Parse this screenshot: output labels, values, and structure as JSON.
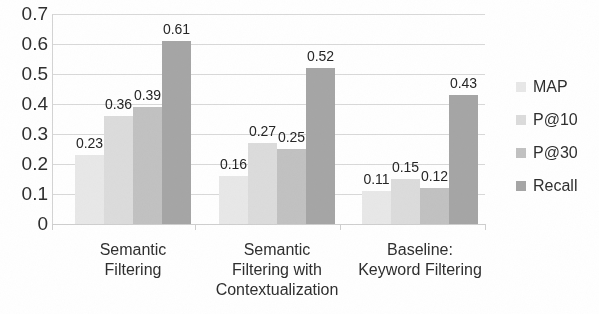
{
  "chart_data": {
    "type": "bar",
    "title": "",
    "xlabel": "",
    "ylabel": "",
    "ylim": [
      0,
      0.7
    ],
    "ytick_labels": [
      "0.7",
      "0.6",
      "0.5",
      "0.4",
      "0.3",
      "0.2",
      "0.1",
      "0"
    ],
    "ytick_values": [
      0.7,
      0.6,
      0.5,
      0.4,
      0.3,
      0.2,
      0.1,
      0
    ],
    "grid": true,
    "legend_position": "right",
    "categories": [
      "Semantic Filtering",
      "Semantic Filtering with Contextualization",
      "Baseline: Keyword Filtering"
    ],
    "category_lines": [
      [
        "Semantic",
        "Filtering"
      ],
      [
        "Semantic",
        "Filtering with",
        "Contextualization"
      ],
      [
        "Baseline:",
        "Keyword Filtering"
      ]
    ],
    "series": [
      {
        "name": "MAP",
        "color": "#e8e8e8",
        "values": [
          0.23,
          0.16,
          0.11
        ],
        "labels": [
          "0.23",
          "0.16",
          "0.11"
        ]
      },
      {
        "name": "P@10",
        "color": "#dcdcdc",
        "values": [
          0.36,
          0.27,
          0.15
        ],
        "labels": [
          "0.36",
          "0.27",
          "0.15"
        ]
      },
      {
        "name": "P@30",
        "color": "#c2c2c2",
        "values": [
          0.39,
          0.25,
          0.12
        ],
        "labels": [
          "0.39",
          "0.25",
          "0.12"
        ]
      },
      {
        "name": "Recall",
        "color": "#a6a6a6",
        "values": [
          0.61,
          0.52,
          0.43
        ],
        "labels": [
          "0.61",
          "0.52",
          "0.43"
        ]
      }
    ]
  },
  "legend": {
    "items": [
      {
        "label": "MAP",
        "color": "#e8e8e8"
      },
      {
        "label": "P@10",
        "color": "#dcdcdc"
      },
      {
        "label": "P@30",
        "color": "#c2c2c2"
      },
      {
        "label": "Recall",
        "color": "#a6a6a6"
      }
    ]
  },
  "axis": {
    "y_ticks": [
      "0.7",
      "0.6",
      "0.5",
      "0.4",
      "0.3",
      "0.2",
      "0.1",
      "0"
    ]
  }
}
